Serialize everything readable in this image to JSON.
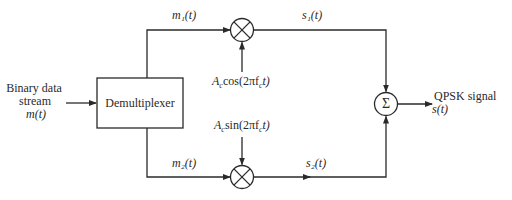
{
  "diagram": {
    "input": {
      "label_line1": "Binary data",
      "label_line2": "stream",
      "label_line3": "m(t)"
    },
    "blocks": {
      "demux": {
        "label": "Demultiplexer"
      },
      "mixer_top": {
        "symbol": "×"
      },
      "mixer_bottom": {
        "symbol": "×"
      },
      "summer": {
        "symbol": "Σ"
      }
    },
    "signals": {
      "m1": "m₁(t)",
      "m2": "m₂(t)",
      "s1": "s₁(t)",
      "s2": "s₂(t)",
      "carrier_cos": "Acos(2πfct)",
      "carrier_cos_parts": {
        "A": "A",
        "sub": "c",
        "rest": "cos(2πf",
        "fsub": "c",
        "end": "t)"
      },
      "carrier_sin_parts": {
        "A": "A",
        "sub": "c",
        "rest": "sin(2πf",
        "fsub": "c",
        "end": "t)"
      }
    },
    "output": {
      "label_line1": "QPSK signal",
      "label_line2": "s(t)"
    },
    "colors": {
      "line": "#2a2a2a",
      "background": "#ffffff"
    }
  }
}
